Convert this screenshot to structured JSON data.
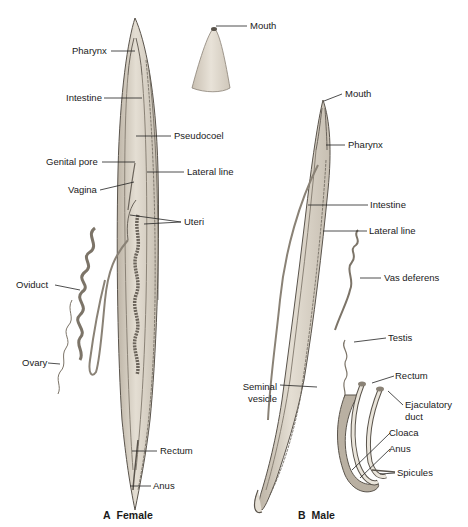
{
  "figure": {
    "female": {
      "caption_letter": "A",
      "caption_text": "Female",
      "labels": {
        "pharynx": "Pharynx",
        "intestine": "Intestine",
        "pseudocoel": "Pseudocoel",
        "genital_pore": "Genital pore",
        "lateral_line": "Lateral line",
        "vagina": "Vagina",
        "uteri": "Uteri",
        "oviduct": "Oviduct",
        "ovary": "Ovary",
        "rectum": "Rectum",
        "anus": "Anus"
      },
      "inset": {
        "mouth": "Mouth"
      }
    },
    "male": {
      "caption_letter": "B",
      "caption_text": "Male",
      "labels": {
        "mouth": "Mouth",
        "pharynx": "Pharynx",
        "intestine": "Intestine",
        "lateral_line": "Lateral line",
        "vas_deferens": "Vas deferens",
        "testis": "Testis",
        "seminal_vesicle_1": "Seminal",
        "seminal_vesicle_2": "vesicle"
      },
      "tail_inset": {
        "rectum": "Rectum",
        "ejaculatory_duct_1": "Ejaculatory",
        "ejaculatory_duct_2": "duct",
        "cloaca": "Cloaca",
        "anus": "Anus",
        "spicules": "Spicules"
      }
    },
    "colors": {
      "body_fill": "#d9d2c5",
      "body_shade": "#b9b0a2",
      "outline": "#5a544c",
      "organ_fill": "#e9e4da",
      "leader": "#222222"
    }
  }
}
